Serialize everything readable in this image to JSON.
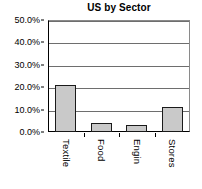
{
  "chart_data": {
    "type": "bar",
    "title": "US by Sector",
    "xlabel": "",
    "ylabel": "",
    "categories": [
      "Textile",
      "Food",
      "Engin",
      "Stores"
    ],
    "values": [
      21.0,
      4.0,
      3.0,
      11.0
    ],
    "ylim": [
      0,
      50
    ],
    "ytick_values": [
      0,
      10,
      20,
      30,
      40,
      50
    ],
    "ytick_labels": [
      "0.0%",
      "10.0%",
      "20.0%",
      "30.0%",
      "40.0%",
      "50.0%"
    ],
    "grid": true,
    "legend": false,
    "bar_fill_color": "#c9c9c9",
    "bar_border_color": "#1a1a1a",
    "axis_color": "#000000",
    "gridline_color": "#6e6e6e",
    "background_color": "#ffffff"
  }
}
